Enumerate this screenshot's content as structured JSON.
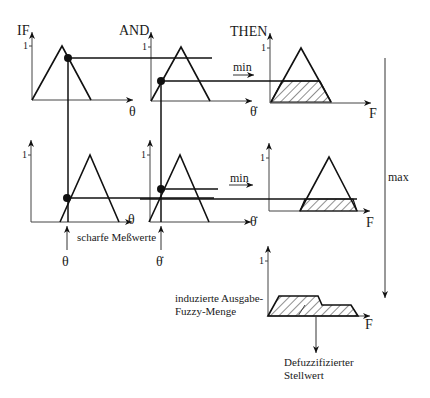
{
  "diagram": {
    "type": "fuzzy-inference-mamdani",
    "headers": {
      "if": "IF",
      "and": "AND",
      "then": "THEN"
    },
    "one_tick": "1",
    "axes": {
      "theta": "θ",
      "theta_dot": "θ̇",
      "force": "F"
    },
    "operators": {
      "min_row1": "min",
      "min_row2": "min",
      "max": "max"
    },
    "labels": {
      "crisp_inputs": "scharfe Meßwerte",
      "input_theta": "θ",
      "input_theta_dot": "θ̇",
      "induced_output_line1": "induzierte Ausgabe-",
      "induced_output_line2": "Fuzzy-Menge",
      "defuzz_line1": "Defuzzifizierter",
      "defuzz_line2": "Stellwert"
    },
    "rules": [
      {
        "row": 1,
        "if_membership": 0.8,
        "and_membership": 0.4,
        "min_result": 0.4
      },
      {
        "row": 2,
        "if_membership": 0.35,
        "and_membership": 0.5,
        "min_result": 0.2
      }
    ],
    "colors": {
      "line": "#111111",
      "background": "#ffffff"
    }
  }
}
